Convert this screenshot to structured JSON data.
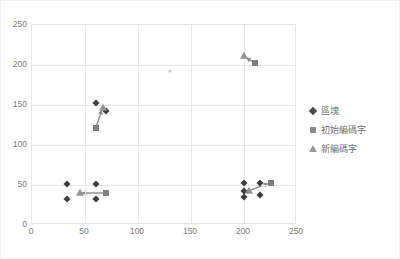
{
  "chart_data": {
    "type": "scatter",
    "title": "",
    "xlabel": "",
    "ylabel": "",
    "xlim": [
      0,
      250
    ],
    "ylim": [
      0,
      250
    ],
    "xticks": [
      0,
      50,
      100,
      150,
      200,
      250
    ],
    "yticks": [
      0,
      50,
      100,
      150,
      200,
      250
    ],
    "grid": true,
    "legend_position": "right",
    "colors": {
      "block": "#3d3d3d",
      "initial_codeword": "#7e7e7e",
      "new_codeword": "#939393",
      "gridline": "#e8e8e8",
      "axis_text": "#7b7b7b"
    },
    "series": [
      {
        "name": "區塊",
        "marker": "diamond",
        "color": "#3d3d3d",
        "points": [
          {
            "x": 33,
            "y": 51
          },
          {
            "x": 33,
            "y": 32
          },
          {
            "x": 60,
            "y": 51
          },
          {
            "x": 60,
            "y": 32
          },
          {
            "x": 60,
            "y": 152
          },
          {
            "x": 70,
            "y": 142
          },
          {
            "x": 200,
            "y": 53
          },
          {
            "x": 200,
            "y": 43
          },
          {
            "x": 200,
            "y": 35
          },
          {
            "x": 215,
            "y": 53
          },
          {
            "x": 215,
            "y": 38
          }
        ]
      },
      {
        "name": "初始編碼字",
        "marker": "square",
        "color": "#7e7e7e",
        "points": [
          {
            "x": 70,
            "y": 40
          },
          {
            "x": 60,
            "y": 121
          },
          {
            "x": 210,
            "y": 203
          },
          {
            "x": 225,
            "y": 52
          }
        ]
      },
      {
        "name": "新編碼字",
        "marker": "triangle",
        "color": "#939393",
        "points": [
          {
            "x": 45,
            "y": 40
          },
          {
            "x": 67,
            "y": 146
          },
          {
            "x": 200,
            "y": 211
          },
          {
            "x": 205,
            "y": 43
          }
        ]
      }
    ],
    "arrows": [
      {
        "from": {
          "x": 70,
          "y": 40
        },
        "to": {
          "x": 47,
          "y": 40
        }
      },
      {
        "from": {
          "x": 60,
          "y": 121
        },
        "to": {
          "x": 66,
          "y": 144
        }
      },
      {
        "from": {
          "x": 210,
          "y": 203
        },
        "to": {
          "x": 202,
          "y": 209
        }
      },
      {
        "from": {
          "x": 205,
          "y": 43
        },
        "to": {
          "x": 223,
          "y": 52
        }
      }
    ],
    "annotations": [
      {
        "x": 130,
        "y": 193,
        "type": "faint-mark"
      }
    ]
  },
  "legend": {
    "items": [
      {
        "label": "區塊",
        "marker": "diamond"
      },
      {
        "label": "初始編碼字",
        "marker": "square"
      },
      {
        "label": "新編碼字",
        "marker": "triangle"
      }
    ]
  },
  "axes": {
    "x_tick_labels": [
      "0",
      "50",
      "100",
      "150",
      "200",
      "250"
    ],
    "y_tick_labels": [
      "0",
      "50",
      "100",
      "150",
      "200",
      "250"
    ]
  }
}
